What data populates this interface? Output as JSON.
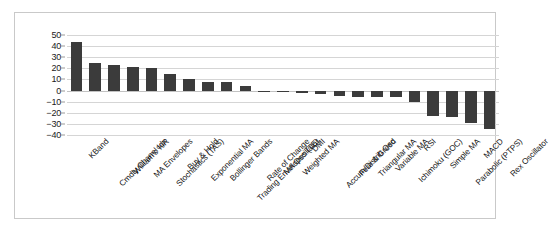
{
  "chart_data": {
    "type": "bar",
    "title": "",
    "subtitle": "",
    "xlabel": "",
    "ylabel": "",
    "ylim": [
      -40,
      50
    ],
    "grid": true,
    "legend": false,
    "orientation": "vertical",
    "bar_color": "#3b3b3b",
    "categories": [
      "KBand",
      "Cmdty Chanel Idx",
      "William's %R",
      "MA Envelopes",
      "Stochastics (TAS)",
      "Buy & Hold",
      "Exponential MA",
      "Bollinger Bands",
      "Trading Envelopes (TE)",
      "Rate of Change",
      "MA Oscillator",
      "Weighted MA",
      "DMI",
      "Accum/Distrib Osc",
      "Fear & Greed",
      "Triangular MA",
      "Variable MA",
      "Ichimoku (GOC)",
      "RSI",
      "Simple MA",
      "Parabolic (PTPS)",
      "MACD",
      "Rex Oscillator"
    ],
    "values": [
      44,
      25,
      23,
      21.5,
      20,
      15,
      10,
      7.5,
      7.5,
      4,
      -0.5,
      -1,
      -2.5,
      -3.5,
      -4.5,
      -5.5,
      -5.5,
      -5.5,
      -10,
      -23,
      -24,
      -29,
      -35
    ],
    "yticks": [
      50,
      40,
      30,
      20,
      10,
      0,
      -10,
      -20,
      -30,
      -40
    ],
    "ytick_labels": [
      "50",
      "40",
      "30",
      "20",
      "10",
      "0",
      "−10",
      "−20",
      "−30",
      "−40"
    ]
  },
  "figure": {
    "border_color": "#c9c9c9",
    "grid_color": "#d5d5d5",
    "background": "#ffffff"
  }
}
